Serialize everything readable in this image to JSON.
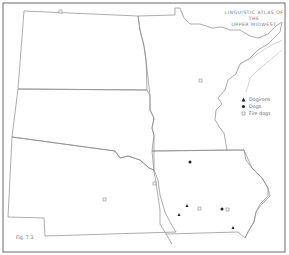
{
  "map": {
    "title_line1": "LINGUISTIC ATLAS OF THE",
    "title_line2": "UPPER MIDWEST",
    "figure_label": "Fig. 7.3",
    "region": "Upper Midwest (North Dakota, South Dakota, Nebraska, Minnesota, Iowa)",
    "legend": [
      {
        "symbol": "triangle",
        "label": "Dogirons"
      },
      {
        "symbol": "filled-circle",
        "label": "Dogs"
      },
      {
        "symbol": "open-circle",
        "label": "Fire dogs"
      }
    ],
    "colors": {
      "line": "#8a8a8a",
      "border": "#6a6a6a",
      "marker": "#222222",
      "open_marker": "#888888"
    }
  }
}
